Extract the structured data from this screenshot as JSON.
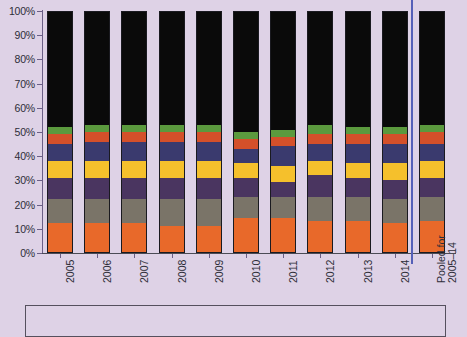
{
  "chart_data": {
    "type": "bar",
    "subtype": "stacked-100-percent",
    "title": "",
    "xlabel": "",
    "ylabel": "",
    "ylim": [
      0,
      100
    ],
    "ytick_labels": [
      "0%",
      "10%",
      "20%",
      "30%",
      "40%",
      "50%",
      "60%",
      "70%",
      "80%",
      "90%",
      "100%"
    ],
    "ytick_values": [
      0,
      10,
      20,
      30,
      40,
      50,
      60,
      70,
      80,
      90,
      100
    ],
    "grid": false,
    "legend_position": "bottom",
    "categories": [
      "2005",
      "2006",
      "2007",
      "2008",
      "2009",
      "2010",
      "2011",
      "2012",
      "2013",
      "2014",
      "Pooled for 2005–14"
    ],
    "series": [
      {
        "name": "series-1",
        "color": "#e8692a",
        "values": [
          12,
          12,
          12,
          11,
          11,
          14,
          14,
          13,
          13,
          12,
          13
        ]
      },
      {
        "name": "series-2",
        "color": "#7a7468",
        "values": [
          10,
          10,
          10,
          11,
          11,
          9,
          9,
          10,
          10,
          10,
          10
        ]
      },
      {
        "name": "series-3",
        "color": "#4a3560",
        "values": [
          9,
          9,
          9,
          9,
          9,
          8,
          6,
          9,
          8,
          8,
          8
        ]
      },
      {
        "name": "series-4",
        "color": "#f5c02c",
        "values": [
          7,
          7,
          7,
          7,
          7,
          6,
          7,
          6,
          6,
          7,
          7
        ]
      },
      {
        "name": "series-5",
        "color": "#3a3a6e",
        "values": [
          7,
          8,
          8,
          8,
          8,
          6,
          8,
          7,
          8,
          8,
          7
        ]
      },
      {
        "name": "series-6",
        "color": "#d4502a",
        "values": [
          4,
          4,
          4,
          4,
          4,
          4,
          4,
          4,
          4,
          4,
          5
        ]
      },
      {
        "name": "series-7",
        "color": "#5b9a3e",
        "values": [
          3,
          3,
          3,
          3,
          3,
          3,
          3,
          4,
          3,
          3,
          3
        ]
      },
      {
        "name": "series-8",
        "color": "#0a0a0a",
        "values": [
          48,
          47,
          47,
          47,
          47,
          50,
          49,
          47,
          48,
          48,
          47
        ]
      }
    ],
    "separator": {
      "name": "pooled-separator",
      "after_category": "2014",
      "color": "#5560b8"
    },
    "colors": {
      "background": "#ded2e6",
      "axis": "#6b5f86",
      "text": "#2d2d38",
      "separator": "#5560b8",
      "legend_border": "#55505e"
    }
  },
  "legend": {
    "entries": []
  }
}
